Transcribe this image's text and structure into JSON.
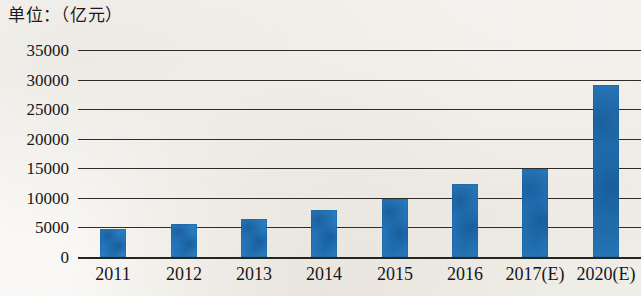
{
  "chart_data": {
    "type": "bar",
    "title": "单位：（亿元）",
    "xlabel": "",
    "ylabel": "",
    "unit": "亿元",
    "categories": [
      "2011",
      "2012",
      "2013",
      "2014",
      "2015",
      "2016",
      "2017(E)",
      "2020(E)"
    ],
    "values": [
      4800,
      5600,
      6500,
      8000,
      9800,
      12300,
      14800,
      29100
    ],
    "ylim": [
      0,
      35000
    ],
    "yticks": [
      0,
      5000,
      10000,
      15000,
      20000,
      25000,
      30000,
      35000
    ],
    "ytick_labels": [
      "0",
      "5000",
      "10000",
      "15000",
      "20000",
      "25000",
      "30000",
      "35000"
    ],
    "grid": true,
    "legend": false,
    "series": [
      {
        "name": "规模",
        "color": "#2a7cc0",
        "values": [
          4800,
          5600,
          6500,
          8000,
          9800,
          12300,
          14800,
          29100
        ]
      }
    ]
  },
  "colors": {
    "bar": "#2a7cc0",
    "grid": "#2e2c2b",
    "axis": "#26241f",
    "background": "#f8f6f3",
    "text": "#17161a"
  }
}
